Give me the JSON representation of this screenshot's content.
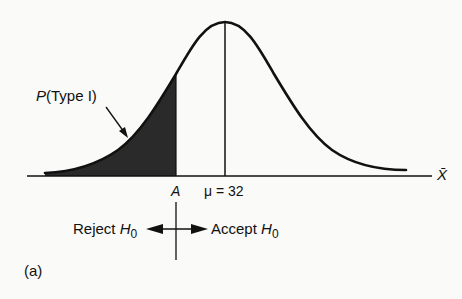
{
  "figure": {
    "panel_label": "(a)",
    "curve_type": "normal distribution",
    "shaded_region_label": {
      "prefix": "P",
      "rest": "(Type I)"
    },
    "axis_label": "X̄",
    "critical_value_label": "A",
    "mean_label": "μ = 32",
    "reject_label": {
      "text": "Reject ",
      "var": "H",
      "sub": "0"
    },
    "accept_label": {
      "text": "Accept ",
      "var": "H",
      "sub": "0"
    },
    "colors": {
      "ink": "#111111",
      "shade": "#2a2a2a",
      "background": "#fafaf8"
    }
  }
}
